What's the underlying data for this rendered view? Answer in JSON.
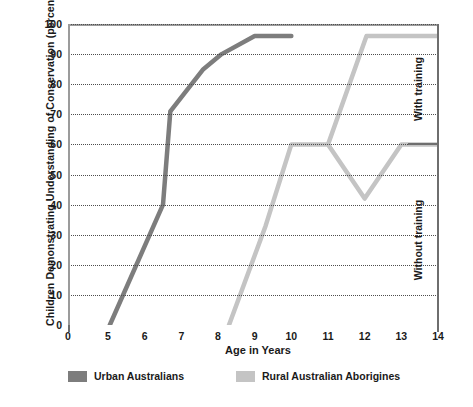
{
  "chart_data": {
    "type": "line",
    "title": "",
    "xlabel": "Age in Years",
    "ylabel": "Children Demonstrating Understanding of Conservation (percent)",
    "xlim": [
      0,
      14
    ],
    "ylim": [
      0,
      100
    ],
    "xticks": [
      0,
      5,
      6,
      7,
      8,
      9,
      10,
      11,
      12,
      13,
      14
    ],
    "yticks": [
      0,
      10,
      20,
      30,
      40,
      50,
      60,
      70,
      80,
      90,
      100
    ],
    "grid": true,
    "legend_position": "bottom",
    "annotations": [
      {
        "text": "With training",
        "position": "right-upper",
        "orientation": "vertical"
      },
      {
        "text": "Without training",
        "position": "right-lower",
        "orientation": "vertical"
      }
    ],
    "series": [
      {
        "name": "Urban Australians",
        "color": "#7d7d7d",
        "points": [
          {
            "x": 5.05,
            "y": 0
          },
          {
            "x": 6.5,
            "y": 40
          },
          {
            "x": 6.7,
            "y": 71
          },
          {
            "x": 7.6,
            "y": 85
          },
          {
            "x": 8.1,
            "y": 90
          },
          {
            "x": 9.0,
            "y": 96
          },
          {
            "x": 10.0,
            "y": 96
          }
        ]
      },
      {
        "name": "Rural Australian Aborigines",
        "color": "#c4c4c4",
        "points": [
          {
            "x": 8.3,
            "y": 0
          },
          {
            "x": 9.3,
            "y": 33
          },
          {
            "x": 10.0,
            "y": 60
          },
          {
            "x": 11.0,
            "y": 60
          },
          {
            "x": 12.0,
            "y": 42
          },
          {
            "x": 13.0,
            "y": 60
          },
          {
            "x": 14.0,
            "y": 60
          }
        ],
        "branch": {
          "label": "with training",
          "points": [
            {
              "x": 11.0,
              "y": 60
            },
            {
              "x": 12.05,
              "y": 96
            },
            {
              "x": 14.0,
              "y": 96
            }
          ]
        }
      }
    ]
  },
  "axes": {
    "y_title": "Children Demonstrating Understanding of Conservation (percent)",
    "x_title": "Age in Years",
    "y_tick_labels": [
      "100",
      "90",
      "80",
      "70",
      "60",
      "50",
      "40",
      "30",
      "20",
      "10",
      "0"
    ],
    "x_tick_labels": [
      "0",
      "5",
      "6",
      "7",
      "8",
      "9",
      "10",
      "11",
      "12",
      "13",
      "14"
    ]
  },
  "side_annotations": {
    "upper": "With training",
    "lower": "Without training"
  },
  "legend": {
    "items": [
      {
        "label": "Urban Australians",
        "color": "#7d7d7d"
      },
      {
        "label": "Rural Australian Aborigines",
        "color": "#c4c4c4"
      }
    ]
  },
  "colors": {
    "urban": "#7d7d7d",
    "rural": "#c4c4c4",
    "grid": "#4d4d4d",
    "frame": "#9b9b9b",
    "text": "#1a1a1a",
    "background": "#ffffff"
  }
}
